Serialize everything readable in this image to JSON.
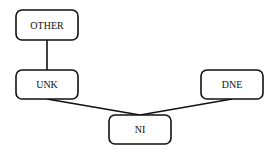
{
  "diagram": {
    "type": "hierarchy",
    "nodes": [
      {
        "id": "other",
        "label": "OTHER"
      },
      {
        "id": "unk",
        "label": "UNK"
      },
      {
        "id": "dne",
        "label": "DNE"
      },
      {
        "id": "ni",
        "label": "NI"
      }
    ],
    "edges": [
      {
        "from": "other",
        "to": "unk"
      },
      {
        "from": "unk",
        "to": "ni"
      },
      {
        "from": "dne",
        "to": "ni"
      }
    ]
  }
}
